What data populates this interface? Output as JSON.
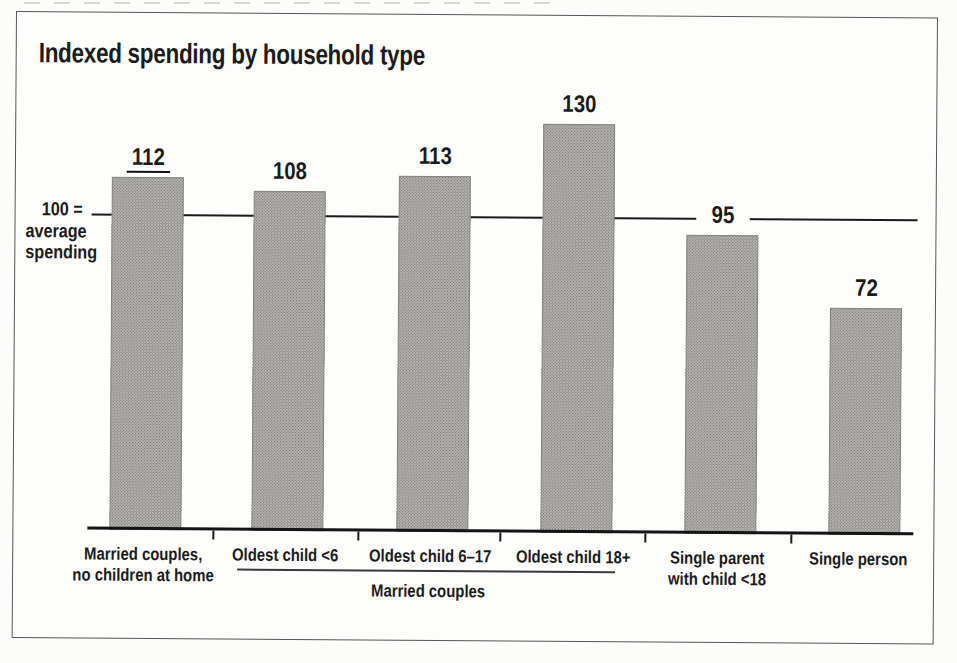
{
  "chart_data": {
    "type": "bar",
    "title": "Indexed spending by household type",
    "categories": [
      "Married couples, no children at home",
      "Oldest child <6",
      "Oldest child 6–17",
      "Oldest child 18+",
      "Single parent with child <18",
      "Single person"
    ],
    "category_lines": [
      [
        "Married couples,",
        "no children at home"
      ],
      [
        "Oldest child <6"
      ],
      [
        "Oldest child 6–17"
      ],
      [
        "Oldest child 18+"
      ],
      [
        "Single parent",
        "with child <18"
      ],
      [
        "Single person"
      ]
    ],
    "values": [
      112,
      108,
      113,
      130,
      95,
      72
    ],
    "reference_line": {
      "value": 100,
      "label_lines": [
        "100 =",
        "average",
        "spending"
      ]
    },
    "group_annotation": {
      "label": "Married couples",
      "span_categories": [
        "Oldest child <6",
        "Oldest child 6–17",
        "Oldest child 18+"
      ]
    },
    "ylim": [
      0,
      160
    ],
    "grid": false,
    "legend": false,
    "bar_color": "#b3b2af",
    "bar_halftone_dot_color": "#716f6c",
    "text_color": "#1b1b1b",
    "line_color": "#1a1a1a"
  }
}
